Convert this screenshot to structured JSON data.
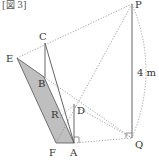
{
  "figure": {
    "title": "[図 3]",
    "height_label": "4 m",
    "points": {
      "P": {
        "label": "P",
        "x": 132,
        "y": 4
      },
      "C": {
        "label": "C",
        "x": 45,
        "y": 43
      },
      "E": {
        "label": "E",
        "x": 17,
        "y": 58
      },
      "B": {
        "label": "B",
        "x": 44,
        "y": 77
      },
      "R": {
        "label": "R",
        "x": 55,
        "y": 110
      },
      "D": {
        "label": "D",
        "x": 75,
        "y": 106
      },
      "F": {
        "label": "F",
        "x": 56,
        "y": 143
      },
      "A": {
        "label": "A",
        "x": 74,
        "y": 143
      },
      "Q": {
        "label": "Q",
        "x": 132,
        "y": 138
      }
    },
    "colors": {
      "line": "#555555",
      "dotted": "#888888",
      "shade": "#bfbfbf"
    }
  }
}
